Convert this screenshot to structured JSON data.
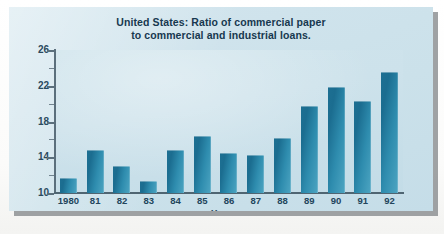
{
  "figure": {
    "title_line1": "United States: Ratio of commercial paper",
    "title_line2": "to commercial and industrial loans.",
    "colors": {
      "bar": "#1d6f92",
      "panel_background": "#cfe3ec",
      "axis": "#5b6f7c",
      "title_text": "#17384f",
      "shadow": "#8e9294"
    }
  },
  "chart_data": {
    "type": "bar",
    "title": "United States: Ratio of commercial paper to commercial and industrial loans.",
    "xlabel": "Year",
    "ylabel": "",
    "categories": [
      "1980",
      "81",
      "82",
      "83",
      "84",
      "85",
      "86",
      "87",
      "88",
      "89",
      "90",
      "91",
      "92"
    ],
    "values": [
      11.7,
      14.8,
      13.0,
      11.3,
      14.8,
      16.4,
      14.5,
      14.3,
      16.1,
      19.7,
      21.9,
      20.3,
      23.5
    ],
    "ylim": [
      10,
      26
    ],
    "yticks": [
      10,
      14,
      18,
      22,
      26
    ],
    "ytick_labels": [
      "10",
      "14",
      "18",
      "22",
      "26"
    ],
    "yminor_ticks": [
      12,
      16,
      20,
      24
    ],
    "grid": false,
    "legend": null
  }
}
